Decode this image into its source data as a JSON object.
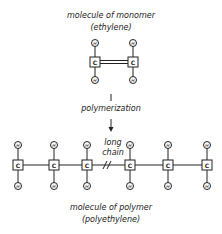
{
  "monomer": {
    "title": "molecule of monomer",
    "subtitle": "(ethylene)",
    "carbon_label": "C",
    "hydrogen_label": "H",
    "carbons": [
      {
        "x": 95,
        "y": 62
      },
      {
        "x": 133,
        "y": 62
      }
    ],
    "hydrogens_top_y": 43,
    "hydrogens_bottom_y": 80,
    "bond_type": "double"
  },
  "process": {
    "label": "polymerization"
  },
  "polymer": {
    "chain_label_line1": "long",
    "chain_label_line2": "chain",
    "title": "molecule of polymer",
    "subtitle": "(polyethylene)",
    "carbon_label": "C",
    "hydrogen_label": "H",
    "carbon_x": [
      18,
      54,
      87,
      130,
      168,
      207
    ],
    "carbon_y": 165,
    "hydrogens_top_y": 145,
    "hydrogens_bottom_y": 186,
    "break_mark": "//"
  }
}
